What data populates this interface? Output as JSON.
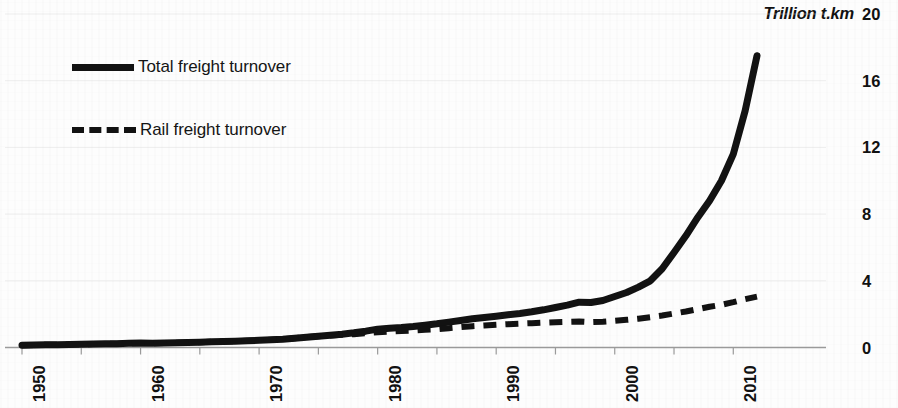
{
  "chart_data": {
    "type": "line",
    "title": "",
    "subtitle": "",
    "xlabel": "",
    "ylabel": "Trillion t.km",
    "ylabel_italic": true,
    "xlim": [
      1950,
      2013
    ],
    "ylim": [
      0,
      20
    ],
    "y_ticks": [
      0,
      4,
      8,
      12,
      16,
      20
    ],
    "y_tick_labels": [
      "0",
      "4",
      "8",
      "12",
      "16",
      "20"
    ],
    "x_ticks": [
      1950,
      1955,
      1960,
      1965,
      1970,
      1975,
      1980,
      1985,
      1990,
      1995,
      2000,
      2005,
      2010
    ],
    "x_tick_labels": [
      "1950",
      "",
      "1960",
      "",
      "1970",
      "",
      "1980",
      "",
      "1990",
      "",
      "2000",
      "",
      "2010"
    ],
    "x_labeled_ticks": [
      1950,
      1960,
      1970,
      1980,
      1990,
      2000,
      2010
    ],
    "grid": "horizontal",
    "legend_position": "upper-left",
    "x": [
      1950,
      1951,
      1952,
      1953,
      1954,
      1955,
      1956,
      1957,
      1958,
      1959,
      1960,
      1961,
      1962,
      1963,
      1964,
      1965,
      1966,
      1967,
      1968,
      1969,
      1970,
      1971,
      1972,
      1973,
      1974,
      1975,
      1976,
      1977,
      1978,
      1979,
      1980,
      1981,
      1982,
      1983,
      1984,
      1985,
      1986,
      1987,
      1988,
      1989,
      1990,
      1991,
      1992,
      1993,
      1994,
      1995,
      1996,
      1997,
      1998,
      1999,
      2000,
      2001,
      2002,
      2003,
      2004,
      2005,
      2006,
      2007,
      2008,
      2009,
      2010,
      2011,
      2012
    ],
    "series": [
      {
        "name": "Total freight turnover",
        "style": "solid",
        "color": "#121212",
        "values": [
          0.14,
          0.15,
          0.16,
          0.17,
          0.18,
          0.19,
          0.21,
          0.22,
          0.23,
          0.25,
          0.27,
          0.26,
          0.27,
          0.28,
          0.3,
          0.32,
          0.34,
          0.36,
          0.38,
          0.4,
          0.43,
          0.46,
          0.5,
          0.56,
          0.62,
          0.68,
          0.74,
          0.8,
          0.88,
          0.98,
          1.1,
          1.16,
          1.2,
          1.26,
          1.34,
          1.42,
          1.52,
          1.62,
          1.72,
          1.8,
          1.88,
          1.96,
          2.04,
          2.14,
          2.26,
          2.4,
          2.54,
          2.72,
          2.7,
          2.82,
          3.06,
          3.3,
          3.62,
          4.0,
          4.72,
          5.7,
          6.7,
          7.8,
          8.8,
          10.0,
          11.6,
          14.2,
          17.5
        ]
      },
      {
        "name": "Rail freight turnover",
        "style": "dashed",
        "color": "#121212",
        "values": [
          0.14,
          0.15,
          0.16,
          0.17,
          0.18,
          0.19,
          0.21,
          0.22,
          0.23,
          0.25,
          0.27,
          0.26,
          0.27,
          0.28,
          0.3,
          0.32,
          0.34,
          0.36,
          0.38,
          0.4,
          0.43,
          0.46,
          0.5,
          0.56,
          0.62,
          0.68,
          0.72,
          0.76,
          0.8,
          0.86,
          0.92,
          0.96,
          0.99,
          1.02,
          1.06,
          1.1,
          1.16,
          1.22,
          1.28,
          1.32,
          1.36,
          1.4,
          1.43,
          1.46,
          1.49,
          1.52,
          1.54,
          1.56,
          1.52,
          1.55,
          1.6,
          1.66,
          1.73,
          1.82,
          1.92,
          2.04,
          2.16,
          2.3,
          2.44,
          2.56,
          2.72,
          2.9,
          3.05
        ]
      }
    ]
  },
  "axis": {
    "y_title": "Trillion t.km"
  },
  "legend": {
    "items": [
      {
        "label": "Total freight turnover",
        "style": "solid"
      },
      {
        "label": "Rail freight turnover",
        "style": "dashed"
      }
    ]
  }
}
